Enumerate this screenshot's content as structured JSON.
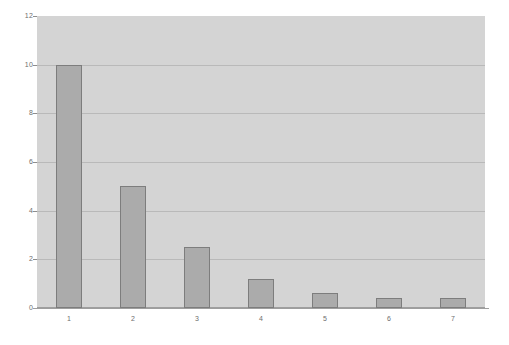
{
  "chart_data": {
    "type": "bar",
    "title": "",
    "subtitle": "",
    "xlabel": "",
    "ylabel": "",
    "categories": [
      "1",
      "2",
      "3",
      "4",
      "5",
      "6",
      "7"
    ],
    "values": [
      10,
      5,
      2.5,
      1.2,
      0.6,
      0.4,
      0.4
    ],
    "series": [
      {
        "name": "",
        "values": [
          10,
          5,
          2.5,
          1.2,
          0.6,
          0.4,
          0.4
        ]
      }
    ],
    "ylim": [
      0,
      12
    ],
    "ytick_labels": [
      "0",
      "2",
      "4",
      "6",
      "8",
      "10",
      "12"
    ],
    "ytick_values": [
      0,
      2,
      4,
      6,
      8,
      10,
      12
    ],
    "xtick_labels": [
      "1",
      "2",
      "3",
      "4",
      "5",
      "6",
      "7"
    ],
    "grid": true,
    "grid_axis": "y",
    "legend": false,
    "legend_position": "none",
    "annotations": []
  },
  "style": {
    "page_background": "#ffffff",
    "plot_background": "#d4d4d4",
    "gridline_color": "#b9b9b9",
    "axis_color": "#9e9e9e",
    "bar_fill": "#ababab",
    "bar_border": "#7d7d7d",
    "tick_label_color": "#6e6e6e"
  }
}
